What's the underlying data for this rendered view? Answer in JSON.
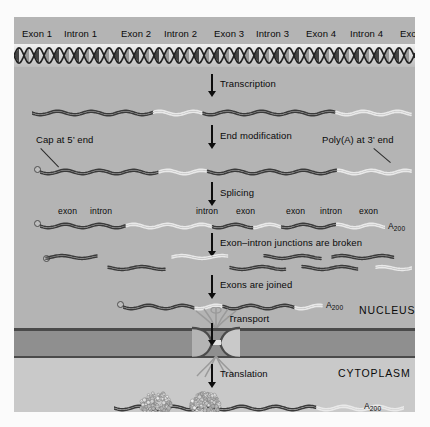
{
  "figure": {
    "title_regions": {
      "nucleus": "NUCLEUS",
      "cytoplasm": "CYTOPLASM"
    }
  },
  "gene_map": {
    "segments": [
      {
        "label": "Exon 1",
        "type": "exon",
        "x": 22,
        "w": 40
      },
      {
        "label": "Intron 1",
        "type": "intron",
        "x": 64,
        "w": 50
      },
      {
        "label": "Exon 2",
        "type": "exon",
        "x": 121,
        "w": 40
      },
      {
        "label": "Intron 2",
        "type": "intron",
        "x": 164,
        "w": 48
      },
      {
        "label": "Exon 3",
        "type": "exon",
        "x": 214,
        "w": 40
      },
      {
        "label": "Intron 3",
        "type": "intron",
        "x": 256,
        "w": 48
      },
      {
        "label": "Exon 4",
        "type": "exon",
        "x": 306,
        "w": 40
      },
      {
        "label": "Intron 4",
        "type": "intron",
        "x": 350,
        "w": 48
      },
      {
        "label": "Exon 5",
        "type": "exon",
        "x": 400,
        "w": 38
      }
    ]
  },
  "steps": [
    {
      "id": "transcription",
      "label": "Transcription"
    },
    {
      "id": "end-modification",
      "label": "End modification"
    },
    {
      "id": "splicing",
      "label": "Splicing"
    },
    {
      "id": "junctions-broken",
      "label": "Exon–intron junctions are broken"
    },
    {
      "id": "exons-joined",
      "label": "Exons are joined"
    },
    {
      "id": "transport",
      "label": "Transport"
    },
    {
      "id": "translation",
      "label": "Translation"
    }
  ],
  "annotations": {
    "cap_5_prime": "Cap at 5’ end",
    "poly_a_3_prime": "Poly(A) at 3’ end",
    "poly_a_tail": "A",
    "poly_a_tail_sub": "200"
  },
  "spliced_labels": [
    {
      "text": "exon",
      "x": 44
    },
    {
      "text": "intron",
      "x": 76
    },
    {
      "text": "intron",
      "x": 182
    },
    {
      "text": "exon",
      "x": 222
    },
    {
      "text": "exon",
      "x": 272
    },
    {
      "text": "intron",
      "x": 306
    },
    {
      "text": "exon",
      "x": 345
    }
  ],
  "colors": {
    "panel_bg": "#b4b4b4",
    "cytoplasm_bg": "#c9c9c9",
    "membrane": "#8f8f8f",
    "membrane_line": "#4a4a4a",
    "exon_strand": "#3a3a3a",
    "intron_strand": "#e9e9e9",
    "arrow": "#0d0d0d",
    "text": "#0a0a0a",
    "dna_bg": "#d8d8d8"
  }
}
